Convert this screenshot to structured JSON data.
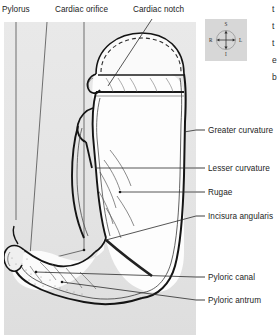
{
  "figure": {
    "background_color": "#ffffff",
    "panel_color": "#e6e6e6",
    "line_color": "#1a1a1a"
  },
  "labels": {
    "top": [
      {
        "id": "pylorus",
        "text": "Pylorus"
      },
      {
        "id": "cardiac-orifice",
        "text": "Cardiac orifice"
      },
      {
        "id": "cardiac-notch",
        "text": "Cardiac notch"
      }
    ],
    "right": [
      {
        "id": "greater-curvature",
        "text": "Greater curvature"
      },
      {
        "id": "lesser-curvature",
        "text": "Lesser curvature"
      },
      {
        "id": "rugae",
        "text": "Rugae"
      },
      {
        "id": "incisura-angularis",
        "text": "Incisura angularis"
      },
      {
        "id": "pyloric-canal",
        "text": "Pyloric canal"
      },
      {
        "id": "pyloric-antrum",
        "text": "Pyloric antrum"
      }
    ]
  },
  "compass": {
    "name": "orientation-compass",
    "superior": "S",
    "inferior": "I",
    "right": "R",
    "left": "L"
  },
  "edge_text": {
    "fragments": [
      "t",
      "t",
      "t",
      "e",
      "b"
    ]
  }
}
